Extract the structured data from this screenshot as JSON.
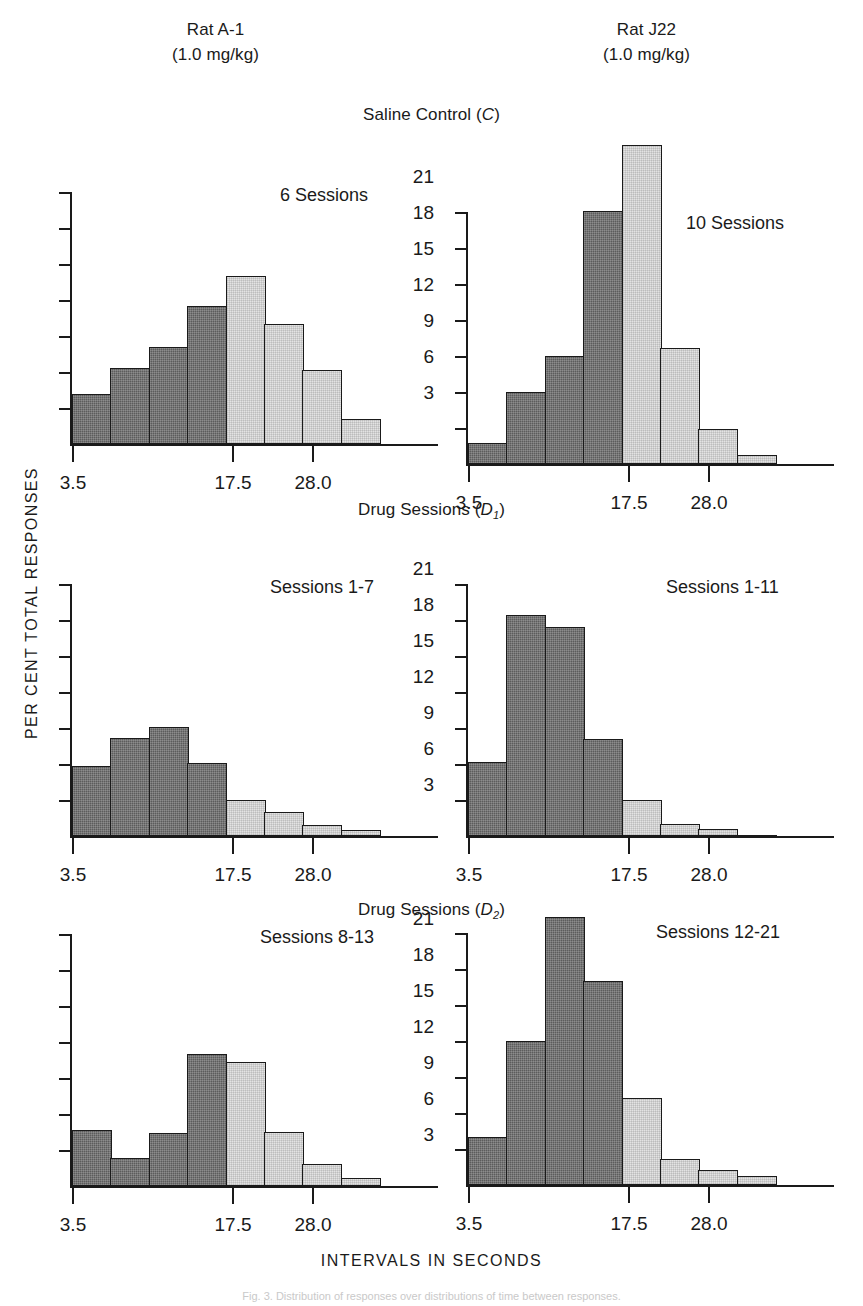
{
  "figure": {
    "xlabel": "INTERVALS IN SECONDS",
    "ylabel": "PER CENT TOTAL RESPONSES",
    "caption": "Fig. 3. Distribution of responses over distributions of time between responses.",
    "colors": {
      "dark_bar": "#5c5c5c",
      "light_bar": "#e3e3e3",
      "axis": "#1a1a1a"
    }
  },
  "subjects": [
    {
      "name": "Rat A-1",
      "dose": "(1.0 mg/kg)"
    },
    {
      "name": "Rat J22",
      "dose": "(1.0 mg/kg)"
    }
  ],
  "sections": [
    {
      "title_text": "Saline Control (C)",
      "title_main": "Saline Control (",
      "title_sub": "C",
      "title_tail": ")",
      "sub_digit": ""
    },
    {
      "title_text": "Drug Sessions (D1)",
      "title_main": "Drug Sessions (",
      "title_sub": "D",
      "title_tail": ")",
      "sub_digit": "1"
    },
    {
      "title_text": "Drug Sessions (D2)",
      "title_main": "Drug Sessions (",
      "title_sub": "D",
      "title_tail": ")",
      "sub_digit": "2"
    }
  ],
  "axis": {
    "yticks": [
      3,
      6,
      9,
      12,
      15,
      18,
      21
    ],
    "ytick_labels": [
      "3",
      "6",
      "9",
      "12",
      "15",
      "18",
      "21"
    ],
    "ymax": 21,
    "xtick_labels": [
      "3.5",
      "17.5",
      "28.0"
    ],
    "xtick_bar_index": [
      0,
      4,
      6
    ]
  },
  "chart_data": {
    "type": "bar",
    "xlabel": "INTERVALS IN SECONDS",
    "ylabel": "PER CENT TOTAL RESPONSES",
    "ylim": [
      0,
      21
    ],
    "grid": false,
    "legend": "none",
    "categories": [
      "3.5",
      "7.0",
      "10.5",
      "14.0",
      "17.5",
      "21.0",
      "24.5",
      "28.0"
    ],
    "xtick_labels": [
      "3.5",
      "17.5",
      "28.0"
    ],
    "bar_shades": [
      "dark",
      "dark",
      "dark",
      "dark",
      "light",
      "light",
      "light",
      "light"
    ],
    "panels": [
      {
        "id": "c-left",
        "subject": "Rat A-1",
        "condition": "Saline Control (C)",
        "note": "6 Sessions",
        "show_ylabels": true,
        "values": [
          4.2,
          6.3,
          8.1,
          11.5,
          14.0,
          10.0,
          6.2,
          2.1
        ]
      },
      {
        "id": "c-right",
        "subject": "Rat J22",
        "condition": "Saline Control (C)",
        "note": "10 Sessions",
        "show_ylabels": false,
        "values": [
          1.8,
          6.0,
          9.0,
          21.1,
          26.6,
          9.7,
          2.9,
          0.8
        ]
      },
      {
        "id": "d1-left",
        "subject": "Rat A-1",
        "condition": "Drug Sessions (D1)",
        "note": "Sessions 1-7",
        "show_ylabels": true,
        "values": [
          5.8,
          8.2,
          9.1,
          6.1,
          3.0,
          2.0,
          0.9,
          0.5
        ]
      },
      {
        "id": "d1-right",
        "subject": "Rat J22",
        "condition": "Drug Sessions (D1)",
        "note": "Sessions 1-11",
        "show_ylabels": false,
        "values": [
          6.2,
          18.4,
          17.4,
          8.1,
          3.0,
          1.0,
          0.6,
          0.0
        ]
      },
      {
        "id": "d2-left",
        "subject": "Rat A-1",
        "condition": "Drug Sessions (D2)",
        "note": "Sessions 8-13",
        "show_ylabels": true,
        "values": [
          4.7,
          2.3,
          4.4,
          11.0,
          10.3,
          4.5,
          1.8,
          0.7
        ]
      },
      {
        "id": "d2-right",
        "subject": "Rat J22",
        "condition": "Drug Sessions (D2)",
        "note": "Sessions 12-21",
        "show_ylabels": false,
        "values": [
          4.0,
          12.0,
          22.3,
          17.0,
          7.2,
          2.1,
          1.2,
          0.7
        ]
      }
    ]
  }
}
